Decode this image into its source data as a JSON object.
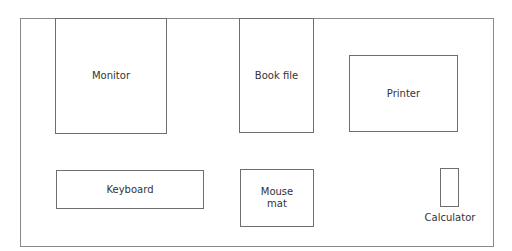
{
  "diagram": {
    "title": "",
    "type": "desk layout",
    "items": [
      {
        "id": "monitor",
        "label": "Monitor"
      },
      {
        "id": "book-file",
        "label": "Book file"
      },
      {
        "id": "printer",
        "label": "Printer"
      },
      {
        "id": "keyboard",
        "label": "Keyboard"
      },
      {
        "id": "mouse-mat",
        "label": "Mouse\nmat",
        "line1": "Mouse",
        "line2": "mat"
      },
      {
        "id": "calculator",
        "label": "Calculator"
      }
    ]
  }
}
